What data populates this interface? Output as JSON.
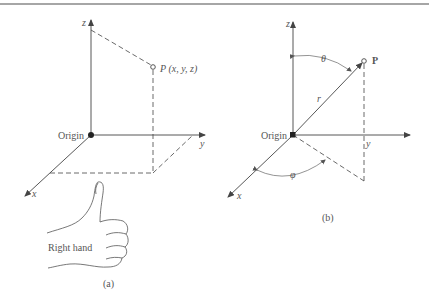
{
  "figure_a": {
    "axes": {
      "z": "z",
      "y": "y",
      "x": "x"
    },
    "origin_label": "Origin",
    "point_label": "P (x, y, z)",
    "hand_label": "Right hand",
    "caption": "(a)"
  },
  "figure_b": {
    "axes": {
      "z": "z",
      "y": "y",
      "x": "x"
    },
    "origin_label": "Origin",
    "point_label": "P",
    "radius_label": "r",
    "theta_label": "θ",
    "phi_label": "φ",
    "caption": "(b)"
  },
  "colors": {
    "line": "#444444",
    "rule": "#777777",
    "text": "#555555"
  }
}
